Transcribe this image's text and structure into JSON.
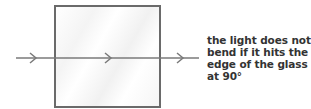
{
  "diagram": {
    "glass_block": {
      "label": "glass block"
    },
    "ray": {
      "color": "#7a7a7a",
      "arrows": 3
    },
    "caption": {
      "lines": [
        "the light does not",
        "bend if it hits the",
        "edge of the glass",
        "at 90°"
      ]
    }
  }
}
